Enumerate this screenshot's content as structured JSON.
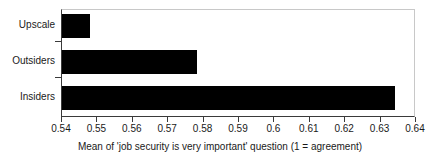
{
  "chart_data": {
    "type": "bar",
    "orientation": "horizontal",
    "title": "",
    "xlabel": "Mean of 'job security is very important' question (1 = agreement)",
    "ylabel": "",
    "categories": [
      "Upscale",
      "Outsiders",
      "Insiders"
    ],
    "values": [
      0.548,
      0.578,
      0.634
    ],
    "series": [
      {
        "name": "Mean of 'job security is very important' question",
        "values": [
          0.548,
          0.578,
          0.634
        ]
      }
    ],
    "xlim": [
      0.54,
      0.64
    ],
    "xticks": [
      0.54,
      0.55,
      0.56,
      0.57,
      0.58,
      0.59,
      0.6,
      0.61,
      0.62,
      0.63,
      0.64
    ],
    "xtick_labels": [
      "0.54",
      "0.55",
      "0.56",
      "0.57",
      "0.58",
      "0.59",
      "0.6",
      "0.61",
      "0.62",
      "0.63",
      "0.64"
    ],
    "grid": false,
    "legend": null,
    "bar_color": "#000000",
    "axis_color": "#3a3a3a",
    "background_color": "#ffffff",
    "annotations": []
  }
}
